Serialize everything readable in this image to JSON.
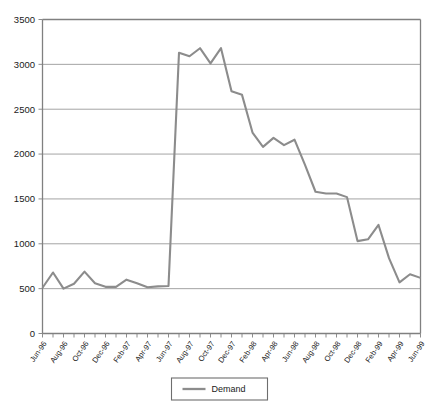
{
  "chart_data": {
    "type": "line",
    "title": "",
    "xlabel": "",
    "ylabel": "",
    "ylim": [
      0,
      3500
    ],
    "ytick_step": 500,
    "yticks": [
      "0",
      "500",
      "1000",
      "1500",
      "2000",
      "2500",
      "3000",
      "3500"
    ],
    "grid": true,
    "legend_position": "bottom",
    "series_color": "#8c8c8c",
    "categories": [
      "Jun-96",
      "Jul-96",
      "Aug-96",
      "Sep-96",
      "Oct-96",
      "Nov-96",
      "Dec-96",
      "Jan-97",
      "Feb-97",
      "Mar-97",
      "Apr-97",
      "May-97",
      "Jun-97",
      "Jul-97",
      "Aug-97",
      "Sep-97",
      "Oct-97",
      "Nov-97",
      "Dec-97",
      "Jan-98",
      "Feb-98",
      "Mar-98",
      "Apr-98",
      "May-98",
      "Jun-98",
      "Jul-98",
      "Aug-98",
      "Sep-98",
      "Oct-98",
      "Nov-98",
      "Dec-98",
      "Jan-99",
      "Feb-99",
      "Mar-99",
      "Apr-99",
      "May-99",
      "Jun-99"
    ],
    "xtick_labels": [
      "Jun-96",
      "Aug-96",
      "Oct-96",
      "Dec-96",
      "Feb-97",
      "Apr-97",
      "Jun-97",
      "Aug-97",
      "Oct-97",
      "Dec-97",
      "Feb-98",
      "Apr-98",
      "Jun-98",
      "Aug-98",
      "Oct-98",
      "Dec-98",
      "Feb-99",
      "Apr-99"
    ],
    "xtick_label_every": 2,
    "series": [
      {
        "name": "Demand",
        "values": [
          510,
          680,
          500,
          555,
          690,
          560,
          520,
          520,
          600,
          560,
          515,
          525,
          530,
          3130,
          3090,
          3180,
          3010,
          3180,
          2700,
          2660,
          2240,
          2080,
          2180,
          2100,
          2160,
          1880,
          1580,
          1560,
          1560,
          1520,
          1030,
          1050,
          1210,
          840,
          570,
          660,
          620
        ]
      }
    ],
    "legend": [
      {
        "label": "Demand",
        "color": "#8c8c8c"
      }
    ]
  }
}
